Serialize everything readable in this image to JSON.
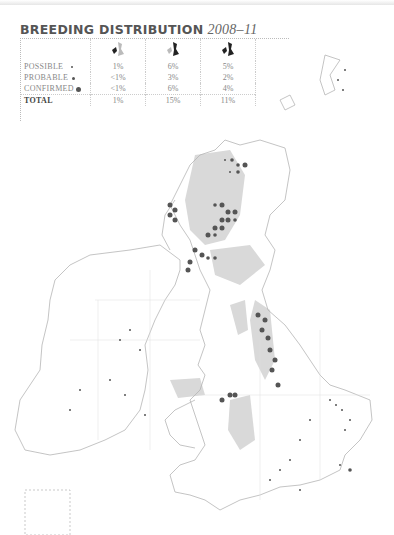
{
  "title": {
    "main": "BREEDING DISTRIBUTION",
    "years": "2008–11"
  },
  "legend": {
    "columns": [
      {
        "icon": "ireland-highlighted-map-icon",
        "label": ""
      },
      {
        "icon": "britain-highlighted-map-icon",
        "label": ""
      },
      {
        "icon": "uk-ireland-map-icon",
        "label": ""
      }
    ],
    "rows": [
      {
        "label": "POSSIBLE",
        "symbol": "small-dot",
        "values": [
          "1%",
          "6%",
          "5%"
        ]
      },
      {
        "label": "PROBABLE",
        "symbol": "medium-dot",
        "values": [
          "<1%",
          "3%",
          "2%"
        ]
      },
      {
        "label": "CONFIRMED",
        "symbol": "large-dot",
        "values": [
          "<1%",
          "6%",
          "4%"
        ]
      },
      {
        "label": "TOTAL",
        "symbol": "",
        "values": [
          "1%",
          "15%",
          "11%"
        ]
      }
    ]
  },
  "colors": {
    "land_shade": "#d9d9d9",
    "coast": "#b5b5b5",
    "dot": "#555555"
  }
}
